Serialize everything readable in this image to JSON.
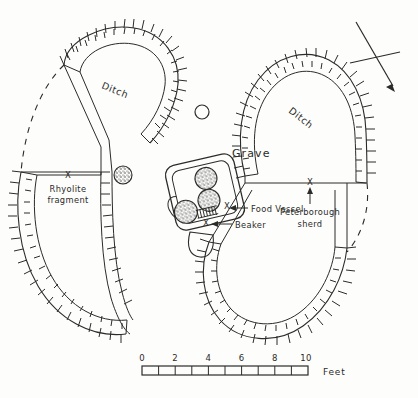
{
  "figure": {
    "kind": "archaeological-site-plan"
  },
  "labels": {
    "ditch_upper_left": "Ditch",
    "ditch_upper_right": "Ditch",
    "grave": "Grave",
    "food_vessel": "Food Vessel",
    "beaker": "Beaker",
    "peterborough_sherd_line1": "Peterborough",
    "peterborough_sherd_line2": "sherd",
    "rhyolite_line1": "Rhyolite",
    "rhyolite_line2": "fragment",
    "find_marker": "X"
  },
  "scale_bar": {
    "ticks": [
      "0",
      "2",
      "4",
      "6",
      "8",
      "10"
    ],
    "unit_label": "Feet",
    "divisions": 10,
    "min": 0,
    "max": 10
  },
  "north_arrow": {
    "name": "north-arrow",
    "direction": "down-right"
  },
  "colors": {
    "ink": "#2b2b28",
    "paper": "#fdfdfc",
    "stipple": "#3a3a35"
  },
  "features": [
    {
      "name": "ditch-arc-northwest",
      "type": "ditch-segment"
    },
    {
      "name": "ditch-arc-northeast",
      "type": "ditch-segment"
    },
    {
      "name": "ditch-arc-southwest",
      "type": "ditch-segment"
    },
    {
      "name": "ditch-arc-southeast",
      "type": "ditch-segment"
    },
    {
      "name": "causeway-west",
      "type": "entrance-causeway"
    },
    {
      "name": "causeway-east",
      "type": "entrance-causeway"
    },
    {
      "name": "central-grave",
      "type": "grave-pit"
    },
    {
      "name": "vessel-upper",
      "type": "pottery-vessel"
    },
    {
      "name": "vessel-middle",
      "type": "pottery-vessel"
    },
    {
      "name": "vessel-lower-left",
      "type": "pottery-vessel"
    },
    {
      "name": "post-hole-north",
      "type": "post-hole"
    },
    {
      "name": "pit-west",
      "type": "pit"
    },
    {
      "name": "small-pit-south-of-grave",
      "type": "pit"
    },
    {
      "name": "projected-ditch-line-west",
      "type": "dashed-projection"
    },
    {
      "name": "projected-ditch-line-east",
      "type": "dashed-projection"
    }
  ]
}
